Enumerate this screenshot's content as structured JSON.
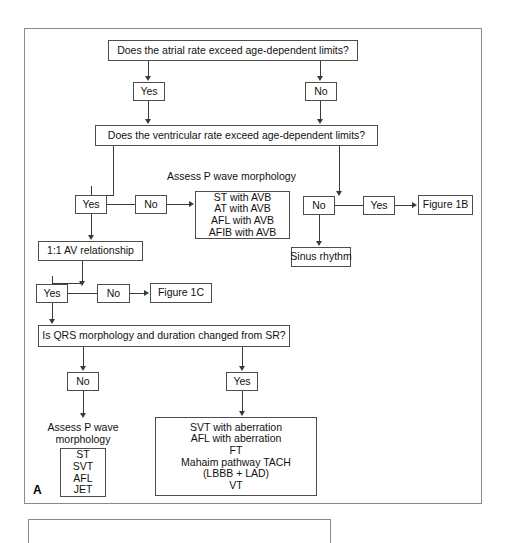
{
  "figure": {
    "panel_letter": "A",
    "nodes": {
      "atrial_rate_question": "Does the atrial rate exceed age-dependent limits?",
      "atrial_yes": "Yes",
      "atrial_no": "No",
      "ventricular_rate_question": "Does the ventricular rate exceed age-dependent limits?",
      "vent_yes": "Yes",
      "vent_no": "No",
      "assess_p_wave_caption_top": "Assess P wave morphology",
      "avb_list": [
        "ST with AVB",
        "AT with AVB",
        "AFL with AVB",
        "AFIB with AVB"
      ],
      "right_no": "No",
      "right_yes": "Yes",
      "figure_1b": "Figure 1B",
      "sinus_rhythm": "Sinus rhythm",
      "av_relationship": "1:1 AV relationship",
      "av_yes": "Yes",
      "av_no": "No",
      "figure_1c": "Figure 1C",
      "qrs_question": "Is QRS morphology and duration changed from SR?",
      "qrs_no": "No",
      "qrs_yes": "Yes",
      "assess_p_wave_caption_bottom_line1": "Assess P wave",
      "assess_p_wave_caption_bottom_line2": "morphology",
      "narrow_qrs_list": [
        "ST",
        "SVT",
        "AFL",
        "JET"
      ],
      "wide_qrs_list": [
        "SVT with aberration",
        "AFL with aberration",
        "FT",
        "Mahaim pathway TACH",
        "(LBBB + LAD)",
        "VT"
      ]
    },
    "colors": {
      "panel_border": "#8a8a8a",
      "node_border": "#4d4d4d",
      "connector": "#3a3a3a",
      "text": "#111111",
      "background": "#ffffff"
    }
  }
}
